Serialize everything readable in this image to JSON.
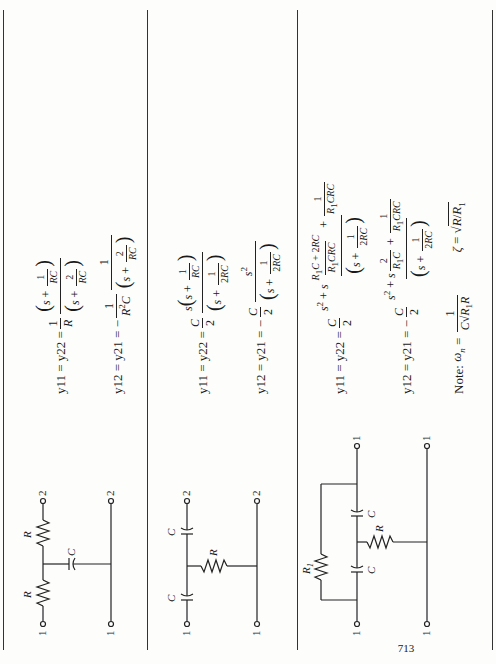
{
  "page": {
    "orientation": "rotated 90 degrees counter-clockwise",
    "page_number": "713"
  },
  "rows": [
    {
      "circuit": {
        "type": "bridged-T",
        "labels": {
          "r_left": "R",
          "r_right": "R",
          "c": "C",
          "port1_top": "1",
          "port1_bottom": "1",
          "port2_top": "2",
          "port2_bottom": "2"
        }
      },
      "equations": [
        {
          "lhs": "y11 = y22 =",
          "coef_num": "1",
          "coef_den": "R",
          "num": "(s + 1/RC)",
          "den": "(s + 2/RC)"
        },
        {
          "lhs": "y12 = y21 = −",
          "coef_num": "1",
          "coef_den": "R²C",
          "num": "1",
          "den": "(s + 2/RC)"
        }
      ]
    },
    {
      "circuit": {
        "type": "T",
        "labels": {
          "c_left": "C",
          "c_right": "C",
          "r": "R",
          "port1_top": "1",
          "port1_bottom": "1",
          "port2_top": "2",
          "port2_bottom": "2"
        }
      },
      "equations": [
        {
          "lhs": "y11 = y22 =",
          "coef_num": "C",
          "coef_den": "2",
          "num": "s(s + 1/RC)",
          "den": "(s + 1/2RC)"
        },
        {
          "lhs": "y12 = y21 = −",
          "coef_num": "C",
          "coef_den": "2",
          "num": "s²",
          "den": "(s + 1/2RC)"
        }
      ]
    },
    {
      "circuit": {
        "type": "bridged-T",
        "labels": {
          "r1": "R1",
          "c_left": "C",
          "c_right": "C",
          "r": "R",
          "port1_top": "1",
          "port1_bottom": "1",
          "port2_top": "1",
          "port2_bottom": "1"
        }
      },
      "equations": [
        {
          "lhs": "y11 = y22 =",
          "coef_num": "C",
          "coef_den": "2",
          "num": "s² + s (R1C + 2RC)/(R1CRC) + 1/(R1CRC)",
          "den": "(s + 1/2RC)"
        },
        {
          "lhs": "y12 = y21 = −",
          "coef_num": "C",
          "coef_den": "2",
          "num": "s² + s 2/(R1C) + 1/(R1CRC)",
          "den": "(s + 1/2RC)"
        }
      ],
      "note": {
        "label": "Note:",
        "omega": "ωn = 1/(C√(R1R))",
        "zeta": "ζ = √(R/R1)"
      }
    }
  ]
}
